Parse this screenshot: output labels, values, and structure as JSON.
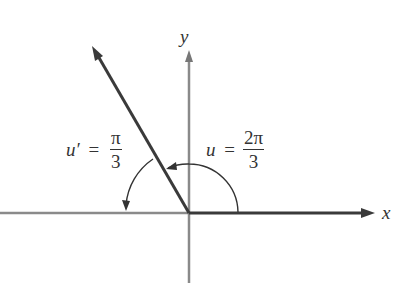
{
  "diagram": {
    "type": "angle_reference_diagram",
    "axes": {
      "x_label": "x",
      "y_label": "y"
    },
    "angle": {
      "variable": "u",
      "equals": "=",
      "numerator": "2π",
      "denominator": "3"
    },
    "reference_angle": {
      "variable": "u′",
      "equals": "=",
      "numerator": "π",
      "denominator": "3"
    },
    "colors": {
      "ray": "#3a3a3a",
      "axis": "#8a8a8a",
      "text": "#333333"
    }
  }
}
